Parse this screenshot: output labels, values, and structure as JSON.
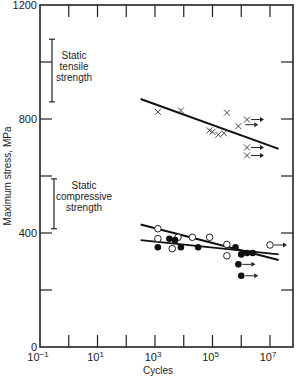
{
  "chart_data": {
    "type": "scatter",
    "title": "",
    "xlabel": "Cycles",
    "ylabel": "Maximum stress, MPa",
    "xscale": "log",
    "xlim_exp": [
      -1,
      7.8
    ],
    "ylim": [
      0,
      1200
    ],
    "x_tick_labels": [
      "10-1",
      "101",
      "103",
      "105",
      "107"
    ],
    "x_tick_exps": [
      -1,
      1,
      3,
      5,
      7
    ],
    "y_tick_labels": [
      "0",
      "400",
      "800",
      "1200"
    ],
    "y_tick_values": [
      0,
      400,
      800,
      1200
    ],
    "grid": false,
    "annotations": [
      {
        "text": "Static tensile strength",
        "range_mpa": [
          860,
          1080
        ]
      },
      {
        "text": "Static compressive strength",
        "range_mpa": [
          415,
          590
        ]
      }
    ],
    "series": [
      {
        "name": "Tension (x)",
        "marker": "x",
        "points_log10N_MPa": [
          [
            3.1,
            825
          ],
          [
            3.9,
            830
          ],
          [
            5.5,
            822
          ],
          [
            4.9,
            760
          ],
          [
            5.0,
            755
          ],
          [
            5.2,
            745
          ],
          [
            5.4,
            750
          ],
          [
            5.9,
            775
          ],
          [
            6.2,
            798
          ],
          [
            6.2,
            700
          ],
          [
            6.2,
            672
          ]
        ],
        "runouts": [
          [
            6.2,
            798
          ],
          [
            6.0,
            780
          ],
          [
            6.2,
            700
          ],
          [
            6.2,
            672
          ]
        ],
        "fit_line": [
          [
            2.5,
            870
          ],
          [
            7.3,
            695
          ]
        ]
      },
      {
        "name": "Compression open circles",
        "marker": "o",
        "points_log10N_MPa": [
          [
            3.1,
            415
          ],
          [
            3.1,
            380
          ],
          [
            3.6,
            345
          ],
          [
            3.8,
            385
          ],
          [
            4.3,
            385
          ],
          [
            4.9,
            385
          ],
          [
            5.5,
            360
          ],
          [
            5.5,
            320
          ],
          [
            7.0,
            358
          ]
        ],
        "runouts": [
          [
            7.0,
            358
          ]
        ]
      },
      {
        "name": "Compression filled circles",
        "marker": "filled",
        "points_log10N_MPa": [
          [
            3.1,
            350
          ],
          [
            3.5,
            380
          ],
          [
            3.7,
            375
          ],
          [
            3.9,
            350
          ],
          [
            4.5,
            350
          ],
          [
            5.8,
            350
          ],
          [
            6.0,
            325
          ],
          [
            6.2,
            330
          ],
          [
            6.4,
            330
          ],
          [
            5.9,
            290
          ],
          [
            6.0,
            250
          ]
        ],
        "runouts": [
          [
            5.9,
            290
          ],
          [
            6.0,
            250
          ]
        ]
      }
    ],
    "compression_fit_lines": [
      [
        [
          2.5,
          430
        ],
        [
          7.3,
          305
        ]
      ],
      [
        [
          2.5,
          375
        ],
        [
          7.3,
          325
        ]
      ]
    ]
  },
  "labels": {
    "tensile_line1": "Static",
    "tensile_line2": "tensile",
    "tensile_line3": "strength",
    "comp_line1": "Static",
    "comp_line2": "compressive",
    "comp_line3": "strength"
  }
}
